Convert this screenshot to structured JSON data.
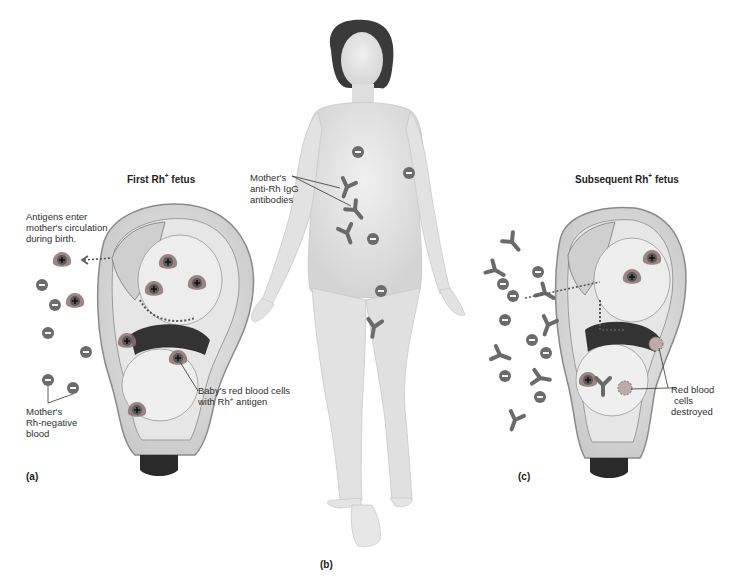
{
  "figure": {
    "panels": {
      "a": {
        "letter": "(a)",
        "title_prefix": "First Rh",
        "title_sup": "+",
        "title_suffix": " fetus",
        "labels": {
          "antigens_line1": "Antigens enter",
          "antigens_line2": "mother's circulation",
          "antigens_line3": "during birth.",
          "mother_line1": "Mother's",
          "mother_line2": "Rh-negative",
          "mother_line3": "blood",
          "baby_line1": "Baby's red blood cells",
          "baby_line2_prefix": "with Rh",
          "baby_line2_sup": "+",
          "baby_line2_suffix": " antigen"
        }
      },
      "b": {
        "letter": "(b)",
        "labels": {
          "antibodies_line1": "Mother's",
          "antibodies_line2": "anti-Rh IgG",
          "antibodies_line3": "antibodies"
        }
      },
      "c": {
        "letter": "(c)",
        "title_prefix": "Subsequent Rh",
        "title_sup": "+",
        "title_suffix": " fetus",
        "labels": {
          "destroyed_line1": "Red blood",
          "destroyed_line2": "cells",
          "destroyed_line3": "destroyed"
        }
      }
    },
    "symbols": {
      "rh_positive": "+",
      "rh_negative": "−"
    },
    "colors": {
      "cell_fill": "#6b6b6b",
      "antigen_core": "#555555",
      "antigen_glow": "#9a7777",
      "antibody": "#6a6a6a",
      "skin": "#e4e4e4",
      "skin_shadow": "#cfcfcf",
      "hair": "#3a3a3a",
      "uterus_wall": "#d8d8d8",
      "uterus_outline": "#8a8a8a",
      "leader_line": "#333333"
    }
  }
}
